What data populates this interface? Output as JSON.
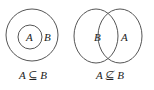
{
  "diagrams": [
    {
      "name": "subset",
      "inner_label": "A",
      "outer_label": "B",
      "caption": "A ⊆ B"
    },
    {
      "name": "not-subset",
      "left_label": "B",
      "right_label": "A",
      "caption": "A ⊈ B"
    }
  ],
  "colors": {
    "stroke": "#555555",
    "text": "#222222"
  }
}
